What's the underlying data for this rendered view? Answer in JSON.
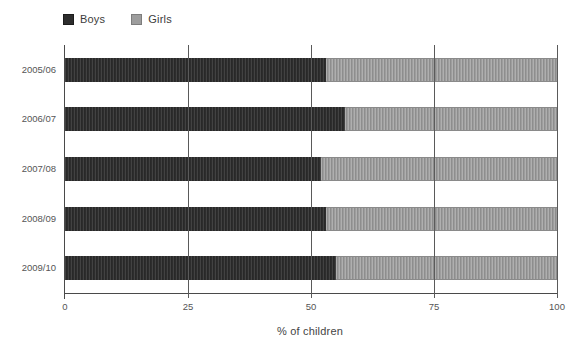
{
  "chart_data": {
    "type": "bar",
    "orientation": "horizontal",
    "stacked": true,
    "title": "",
    "xlabel": "% of children",
    "ylabel": "",
    "xlim": [
      0,
      100
    ],
    "xticks": [
      "0",
      "25",
      "50",
      "75",
      "100"
    ],
    "grid": true,
    "legend_position": "top-left",
    "categories": [
      "2005/06",
      "2006/07",
      "2007/08",
      "2008/09",
      "2009/10"
    ],
    "series": [
      {
        "name": "Boys",
        "color": "#2d2d2d",
        "values": [
          53,
          57,
          52,
          53,
          55
        ]
      },
      {
        "name": "Girls",
        "color": "#9d9d9d",
        "values": [
          47,
          43,
          48,
          47,
          45
        ]
      }
    ]
  },
  "colors": {
    "axis": "#4a4a4a",
    "gridline": "#5a5a5a",
    "tick_text": "#555555",
    "background": "#ffffff"
  }
}
